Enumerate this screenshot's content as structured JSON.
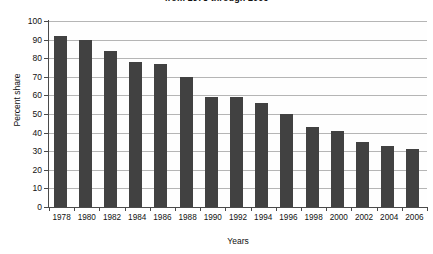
{
  "chart_data": {
    "type": "bar",
    "title": "from 1978 through 2006",
    "xlabel": "Years",
    "ylabel": "Percent share",
    "ylim": [
      0,
      100
    ],
    "ytick_step": 10,
    "grid": true,
    "legend": "none",
    "bar_color": "#414141",
    "categories": [
      "1978",
      "1980",
      "1982",
      "1984",
      "1986",
      "1988",
      "1990",
      "1992",
      "1994",
      "1996",
      "1998",
      "2000",
      "2002",
      "2004",
      "2006"
    ],
    "yticks": [
      "100",
      "90",
      "80",
      "70",
      "60",
      "50",
      "40",
      "30",
      "20",
      "10",
      "0"
    ],
    "values": [
      92,
      90,
      84,
      78,
      77,
      70,
      59,
      59,
      56,
      50,
      43,
      41,
      35,
      33,
      31
    ]
  }
}
